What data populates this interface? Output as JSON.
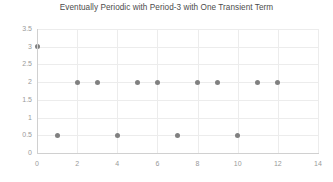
{
  "chart_data": {
    "type": "scatter",
    "title": "Eventually Periodic with Period-3 with One Transient Term",
    "xlabel": "",
    "ylabel": "",
    "x": [
      0,
      1,
      2,
      3,
      4,
      5,
      6,
      7,
      8,
      9,
      10,
      11,
      12
    ],
    "values": [
      3,
      0.5,
      2,
      2,
      0.5,
      2,
      2,
      0.5,
      2,
      2,
      0.5,
      2,
      2
    ],
    "series": [
      {
        "name": "sequence",
        "points": [
          {
            "x": 0,
            "y": 3
          },
          {
            "x": 1,
            "y": 0.5
          },
          {
            "x": 2,
            "y": 2
          },
          {
            "x": 3,
            "y": 2
          },
          {
            "x": 4,
            "y": 0.5
          },
          {
            "x": 5,
            "y": 2
          },
          {
            "x": 6,
            "y": 2
          },
          {
            "x": 7,
            "y": 0.5
          },
          {
            "x": 8,
            "y": 2
          },
          {
            "x": 9,
            "y": 2
          },
          {
            "x": 10,
            "y": 0.5
          },
          {
            "x": 11,
            "y": 2
          },
          {
            "x": 12,
            "y": 2
          }
        ]
      }
    ],
    "xlim": [
      0,
      14
    ],
    "ylim": [
      0,
      3.5
    ],
    "xticks": [
      0,
      2,
      4,
      6,
      8,
      10,
      12,
      14
    ],
    "xtick_labels": [
      "0",
      "2",
      "4",
      "6",
      "8",
      "10",
      "12",
      "14"
    ],
    "yticks": [
      0,
      0.5,
      1,
      1.5,
      2,
      2.5,
      3,
      3.5
    ],
    "ytick_labels": [
      "0",
      "0.5",
      "1",
      "1.5",
      "2",
      "2.5",
      "3",
      "3.5"
    ],
    "grid": true,
    "legend": false,
    "marker_color": "#808080",
    "grid_color": "#ececec",
    "axis_color": "#d0d0d0",
    "tick_label_color": "#9a9a9a",
    "title_color": "#4c4c4c",
    "background": "#ffffff"
  }
}
